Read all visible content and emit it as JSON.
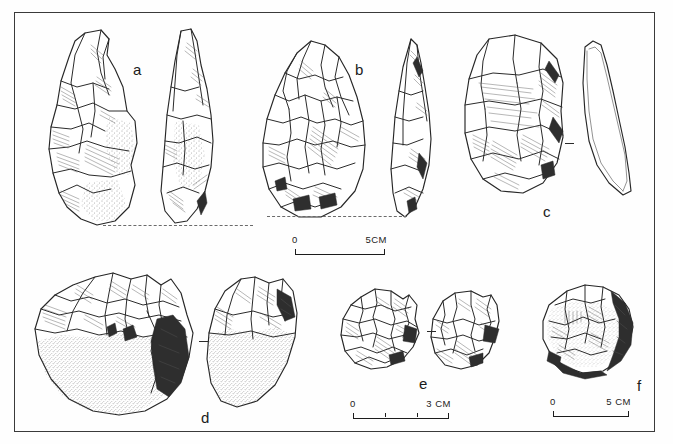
{
  "plate": {
    "title": "Lithic artifact plate",
    "description": "Archaeological line drawings of six stone tools labelled a to f",
    "background_color": "#fefefe",
    "ink_color": "#2b2b2b",
    "frame_color": "#3a3a3a"
  },
  "figures": [
    {
      "id": "a",
      "label": "a",
      "name": "handaxe-biface",
      "views": [
        "face",
        "profile"
      ],
      "row": 1
    },
    {
      "id": "b",
      "label": "b",
      "name": "teardrop-handaxe",
      "views": [
        "face",
        "profile"
      ],
      "row": 1
    },
    {
      "id": "c",
      "label": "c",
      "name": "flake-cleaver",
      "views": [
        "face",
        "profile"
      ],
      "row": 1
    },
    {
      "id": "d",
      "label": "d",
      "name": "cortex-chopper-cobble",
      "views": [
        "face",
        "profile"
      ],
      "row": 2
    },
    {
      "id": "e",
      "label": "e",
      "name": "polyhedral-core",
      "views": [
        "face",
        "profile"
      ],
      "row": 2
    },
    {
      "id": "f",
      "label": "f",
      "name": "spheroid-cobble",
      "views": [
        "face"
      ],
      "row": 2
    }
  ],
  "scales": [
    {
      "id": "scale-top",
      "zero_label": "0",
      "max_label": "5CM",
      "max_value": 5,
      "unit": "CM",
      "ticks": 0,
      "for_figures": [
        "a",
        "b",
        "c"
      ]
    },
    {
      "id": "scale-bottom-left",
      "zero_label": "0",
      "max_label": "3 CM",
      "max_value": 3,
      "unit": "CM",
      "ticks": 3,
      "for_figures": [
        "d",
        "e"
      ]
    },
    {
      "id": "scale-bottom-right",
      "zero_label": "0",
      "max_label": "5 CM",
      "max_value": 5,
      "unit": "CM",
      "ticks": 0,
      "for_figures": [
        "f"
      ]
    }
  ]
}
